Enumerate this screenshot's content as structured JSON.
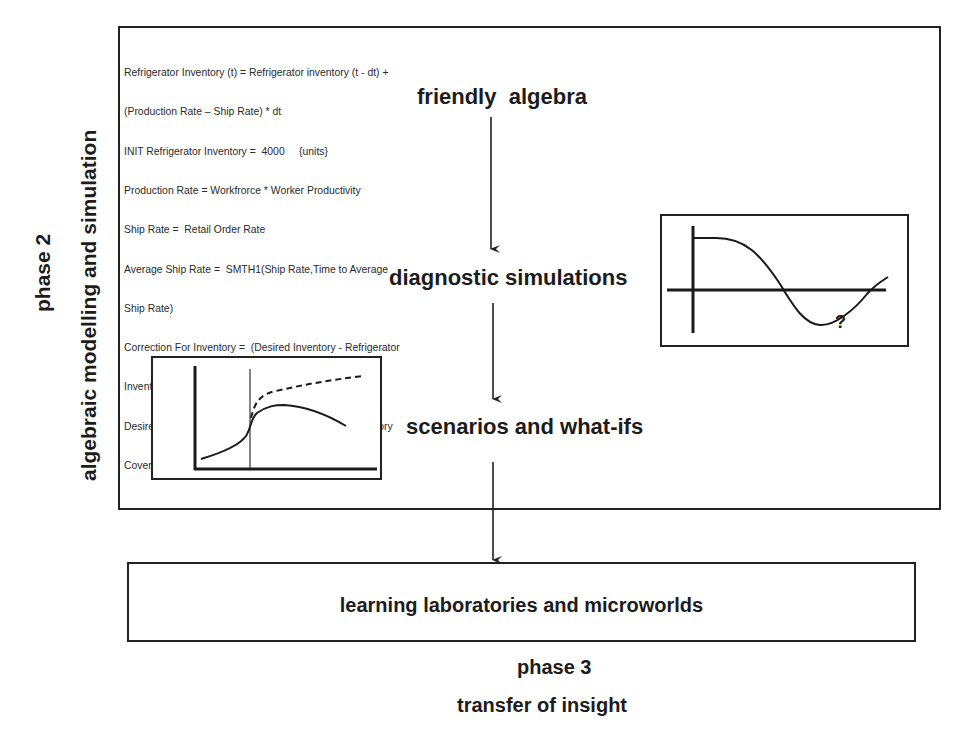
{
  "phase2": {
    "title": "phase 2",
    "subtitle": "algebraic modelling and simulation",
    "equations": [
      "Refrigerator Inventory (t) = Refrigerator inventory (t - dt) +",
      "(Production Rate – Ship Rate) * dt",
      "INIT Refrigerator Inventory =  4000     {units}",
      "Production Rate = Workfrorce * Worker Productivity",
      "Ship Rate =  Retail Order Rate",
      "Average Ship Rate =  SMTH1(Ship Rate,Time to Average",
      "Ship Rate)",
      "Correction For Inventory =  (Desired Inventory - Refrigerator",
      "Inventory)/Time to Correct Inventory",
      "Desired Inventory = Average Ship Rate * Normal Inventory",
      "Coverage"
    ],
    "stages": [
      {
        "label": "friendly  algebra"
      },
      {
        "label": "diagnostic simulations"
      },
      {
        "label": "scenarios and what-ifs"
      }
    ],
    "diagnostic_chart": {
      "annotation": "?",
      "curve": "damped oscillation starting high, crossing zero, dipping below axis, rising again"
    },
    "scenario_chart": {
      "series": [
        {
          "name": "baseline (solid)",
          "style": "solid"
        },
        {
          "name": "what-if (dashed)",
          "style": "dashed"
        }
      ],
      "marker": "vertical line at intervention time"
    }
  },
  "phase3": {
    "box_label": "learning laboratories and microworlds",
    "title": "phase 3",
    "subtitle": "transfer of insight"
  },
  "colors": {
    "line": "#222222",
    "text": "#1c1c1c",
    "background": "#ffffff"
  }
}
